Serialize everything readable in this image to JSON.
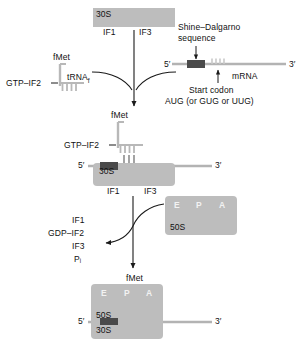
{
  "figure": {
    "colors": {
      "subunit_gray": "#bdbdbd",
      "shine_dalgarno_dark": "#4a4a4a",
      "mrna_gray": "#b3b3b3",
      "trna_gray": "#b8b8b8",
      "line_black": "#1a1a1a",
      "site_label_white": "#f5f5f5",
      "background": "#ffffff"
    }
  },
  "step1": {
    "subunit_30s": {
      "label": "30S",
      "factor_1": "IF1",
      "factor_3": "IF3"
    },
    "trna_complex": {
      "amino_acid": "fMet",
      "factor": "GTP–IF2",
      "trna_label": "tRNA",
      "trna_subscript": "f"
    },
    "mrna": {
      "five_prime": "5′",
      "three_prime": "3′",
      "name": "mRNA",
      "shine_dalgarno_label_line1": "Shine–Dalgarno",
      "shine_dalgarno_label_line2": "sequence",
      "start_codon_line1": "Start codon",
      "start_codon_line2": "AUG (or GUG or UUG)"
    }
  },
  "step2": {
    "complex_label": "fMet",
    "factor": "GTP–IF2",
    "subunit_30s": {
      "label": "30S",
      "factor_1": "IF1",
      "factor_3": "IF3"
    },
    "mrna": {
      "five_prime": "5′",
      "three_prime": "3′"
    }
  },
  "step3": {
    "subunit_50s": {
      "label": "50S",
      "sites": [
        "E",
        "P",
        "A"
      ]
    },
    "released": [
      "IF1",
      "GDP–IF2",
      "IF3",
      "Pᵢ"
    ]
  },
  "step4": {
    "complex_label": "fMet",
    "subunit_50s": {
      "label": "50S",
      "sites": [
        "E",
        "P",
        "A"
      ]
    },
    "subunit_30s": {
      "label": "30S"
    },
    "mrna": {
      "five_prime": "5′",
      "three_prime": "3′"
    }
  }
}
